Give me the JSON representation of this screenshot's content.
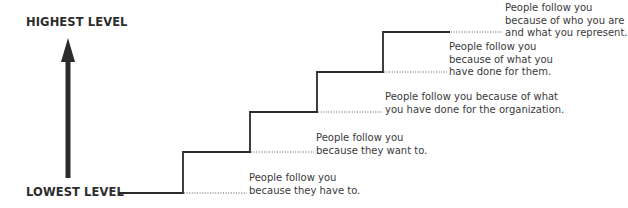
{
  "diagram": {
    "title_top": "HIGHEST LEVEL",
    "title_bottom": "LOWEST LEVEL",
    "arrow": "up-arrow",
    "steps": [
      {
        "level": 1,
        "lines": [
          "People follow you",
          "because they have to."
        ]
      },
      {
        "level": 2,
        "lines": [
          "People follow you",
          "because they want to."
        ]
      },
      {
        "level": 3,
        "lines": [
          "People follow you because of what",
          "you have done for the organization."
        ]
      },
      {
        "level": 4,
        "lines": [
          "People follow you",
          "because of what you",
          "have done for them."
        ]
      },
      {
        "level": 5,
        "lines": [
          "People follow you",
          "because of who you are",
          "and what you represent."
        ]
      }
    ],
    "colors": {
      "line": "#2b2b2b",
      "text": "#3a3a3a"
    }
  }
}
